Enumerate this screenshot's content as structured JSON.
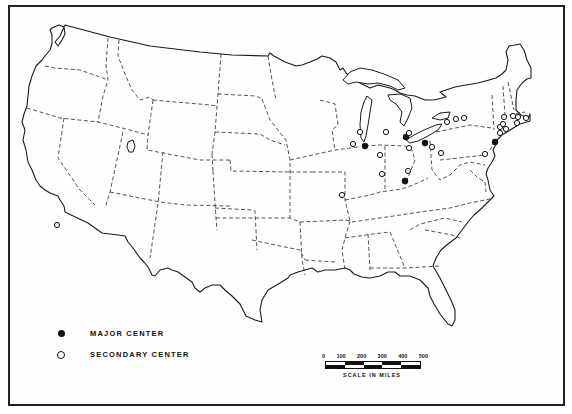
{
  "map": {
    "type": "outline map",
    "region": "Contiguous United States with state boundaries",
    "symbols": {
      "major_center": {
        "shape": "filled-circle",
        "color": "#111111"
      },
      "secondary_center": {
        "shape": "open-circle",
        "color": "#111111"
      }
    },
    "major_centers": [
      {
        "x": 365,
        "y": 146
      },
      {
        "x": 406,
        "y": 137
      },
      {
        "x": 425,
        "y": 143
      },
      {
        "x": 405,
        "y": 181
      },
      {
        "x": 495,
        "y": 142
      }
    ],
    "secondary_centers": [
      {
        "x": 57,
        "y": 225
      },
      {
        "x": 342,
        "y": 195
      },
      {
        "x": 360,
        "y": 132
      },
      {
        "x": 353,
        "y": 144
      },
      {
        "x": 386,
        "y": 132
      },
      {
        "x": 409,
        "y": 133
      },
      {
        "x": 409,
        "y": 148
      },
      {
        "x": 380,
        "y": 155
      },
      {
        "x": 382,
        "y": 174
      },
      {
        "x": 408,
        "y": 171
      },
      {
        "x": 432,
        "y": 147
      },
      {
        "x": 441,
        "y": 153
      },
      {
        "x": 447,
        "y": 122
      },
      {
        "x": 456,
        "y": 119
      },
      {
        "x": 464,
        "y": 118
      },
      {
        "x": 485,
        "y": 154
      },
      {
        "x": 504,
        "y": 117
      },
      {
        "x": 513,
        "y": 116
      },
      {
        "x": 518,
        "y": 117
      },
      {
        "x": 526,
        "y": 118
      },
      {
        "x": 500,
        "y": 127
      },
      {
        "x": 503,
        "y": 124
      },
      {
        "x": 506,
        "y": 129
      },
      {
        "x": 517,
        "y": 123
      },
      {
        "x": 500,
        "y": 133
      }
    ]
  },
  "legend": {
    "items": [
      {
        "symbol": "major",
        "label": "MAJOR CENTER"
      },
      {
        "symbol": "secondary",
        "label": "SECONDARY CENTER"
      }
    ]
  },
  "scale_bar": {
    "ticks": [
      "0",
      "100",
      "200",
      "300",
      "400",
      "500"
    ],
    "caption": "SCALE IN MILES",
    "segments": 5
  }
}
